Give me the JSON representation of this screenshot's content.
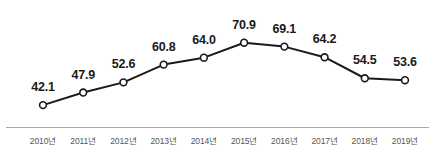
{
  "chart_data": {
    "type": "line",
    "title": "",
    "xlabel": "",
    "ylabel": "",
    "categories": [
      "2010년",
      "2011년",
      "2012년",
      "2013년",
      "2014년",
      "2015년",
      "2016년",
      "2017년",
      "2018년",
      "2019년"
    ],
    "values": [
      42.1,
      47.9,
      52.6,
      60.8,
      64.0,
      70.9,
      69.1,
      64.2,
      54.5,
      53.6
    ],
    "point_labels": [
      "42.1",
      "47.9",
      "52.6",
      "60.8",
      "64.0",
      "70.9",
      "69.1",
      "64.2",
      "54.5",
      "53.6"
    ],
    "ylim": [
      38.0,
      74.0
    ],
    "grid": false,
    "legend": null,
    "series": [
      {
        "name": "",
        "values": [
          42.1,
          47.9,
          52.6,
          60.8,
          64.0,
          70.9,
          69.1,
          64.2,
          54.5,
          53.6
        ]
      }
    ],
    "style": {
      "line_color": "#1a1a1a",
      "marker_fill": "#ffffff",
      "marker_edge": "#1a1a1a",
      "label_color": "#1a1a1a",
      "tick_color": "#55565a",
      "axis_color": "#a8a9ad",
      "background": "#ffffff"
    }
  }
}
